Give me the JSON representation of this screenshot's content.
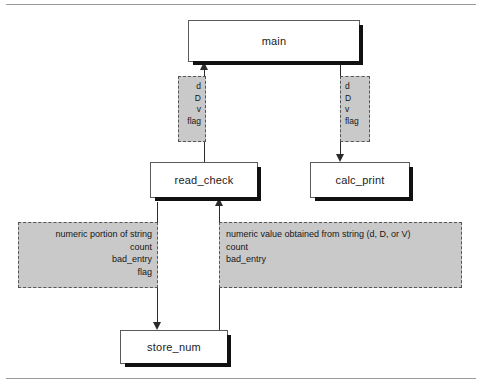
{
  "diagram": {
    "type": "structure-chart",
    "modules": [
      {
        "id": "main",
        "label": "main"
      },
      {
        "id": "read_check",
        "label": "read_check"
      },
      {
        "id": "calc_print",
        "label": "calc_print"
      },
      {
        "id": "store_num",
        "label": "store_num"
      }
    ],
    "flows": {
      "main_from_read_check": {
        "direction": "up",
        "items": [
          "d",
          "D",
          "v",
          "flag"
        ]
      },
      "main_to_calc_print": {
        "direction": "down",
        "items": [
          "d",
          "D",
          "v",
          "flag"
        ]
      },
      "read_check_to_store_num": {
        "direction": "down",
        "items": [
          "numeric portion of string",
          "count",
          "bad_entry",
          "flag"
        ]
      },
      "store_num_to_read_check": {
        "direction": "up",
        "items": [
          "numeric value obtained from string (d, D, or V)",
          "count",
          "bad_entry"
        ]
      }
    },
    "colors": {
      "band_fill": "#c9c9c9",
      "band_border": "#555555",
      "box_border": "#5a5a5a",
      "box_shadow": "#111111",
      "line": "#2a2a2a",
      "rule": "#9a9a9a"
    }
  }
}
